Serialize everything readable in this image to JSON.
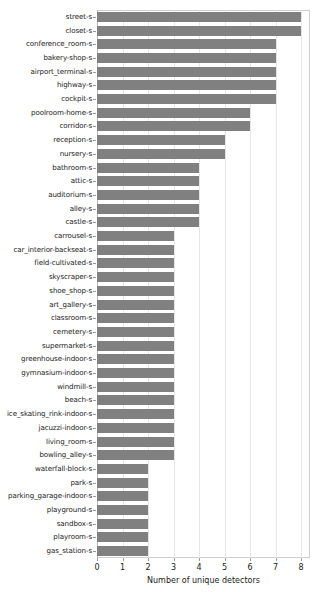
{
  "chart_data": {
    "type": "bar",
    "orientation": "horizontal",
    "title": "",
    "xlabel": "Number of unique detectors",
    "ylabel": "",
    "xlim": [
      0,
      8.35
    ],
    "xticks": [
      0,
      1,
      2,
      3,
      4,
      5,
      6,
      7,
      8
    ],
    "grid": true,
    "legend": null,
    "bar_color": "#808080",
    "categories": [
      "street-s",
      "closet-s",
      "conference_room-s",
      "bakery-shop-s",
      "airport_terminal-s",
      "highway-s",
      "cockpit-s",
      "poolroom-home-s",
      "corridor-s",
      "reception-s",
      "nursery-s",
      "bathroom-s",
      "attic-s",
      "auditorium-s",
      "alley-s",
      "castle-s",
      "carrousel-s",
      "car_interior-backseat-s",
      "field-cultivated-s",
      "skyscraper-s",
      "shoe_shop-s",
      "art_gallery-s",
      "classroom-s",
      "cemetery-s",
      "supermarket-s",
      "greenhouse-indoor-s",
      "gymnasium-indoor-s",
      "windmill-s",
      "beach-s",
      "ice_skating_rink-indoor-s",
      "jacuzzi-indoor-s",
      "living_room-s",
      "bowling_alley-s",
      "waterfall-block-s",
      "park-s",
      "parking_garage-indoor-s",
      "playground-s",
      "sandbox-s",
      "playroom-s",
      "gas_station-s"
    ],
    "values": [
      8,
      8,
      7,
      7,
      7,
      7,
      7,
      6,
      6,
      5,
      5,
      4,
      4,
      4,
      4,
      4,
      3,
      3,
      3,
      3,
      3,
      3,
      3,
      3,
      3,
      3,
      3,
      3,
      3,
      3,
      3,
      3,
      3,
      2,
      2,
      2,
      2,
      2,
      2,
      2
    ]
  }
}
